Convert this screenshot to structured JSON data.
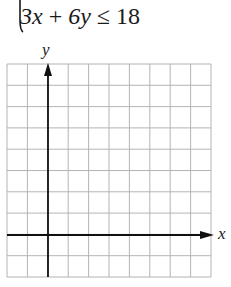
{
  "problem": {
    "inequality": {
      "lhs_term1": "3x",
      "op1": "+",
      "lhs_term2": "6y",
      "relation": "≤",
      "rhs": "18"
    },
    "brace_icon": "left-curly-brace (partial, system of inequalities)"
  },
  "graph": {
    "x_axis_label": "x",
    "y_axis_label": "y",
    "grid": {
      "columns": 10,
      "rows": 10,
      "origin_column_index": 2,
      "origin_row_index_from_top": 8,
      "line_color": "#b4b4b4",
      "axis_color": "#111111"
    }
  }
}
